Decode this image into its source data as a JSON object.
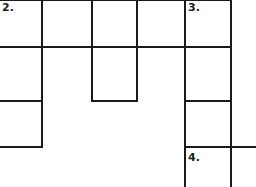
{
  "puzzle": {
    "type": "crossword-fragment",
    "clue_numbers": {
      "c2": "2.",
      "c3": "3.",
      "c4": "4."
    },
    "colors": {
      "line": "#1a1a1a",
      "background": "#ffffff"
    }
  }
}
